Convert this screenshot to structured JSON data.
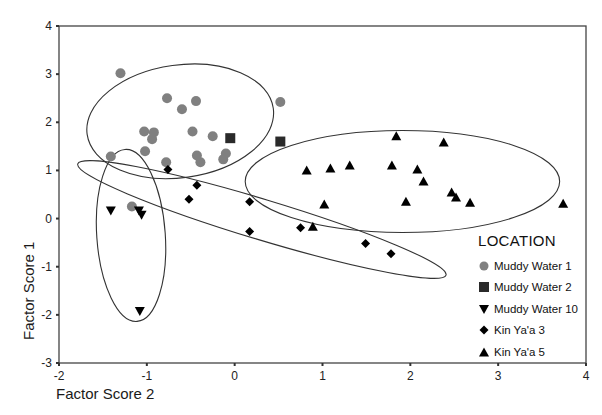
{
  "chart_data": {
    "type": "scatter",
    "title": "",
    "xlabel": "Factor Score 2",
    "ylabel": "Factor Score 1",
    "xlim": [
      -2,
      4
    ],
    "ylim": [
      -3,
      4
    ],
    "xticks": [
      "-2",
      "-1",
      "0",
      "1",
      "2",
      "3",
      "4"
    ],
    "yticks": [
      "4",
      "3",
      "2",
      "1",
      "0",
      "-1",
      "-2",
      "-3"
    ],
    "grid": false,
    "legend": {
      "title": "LOCATION",
      "position": "lower right (inside plot)"
    },
    "series": [
      {
        "name": "Muddy Water 1",
        "marker": "circle",
        "color": "#808080",
        "points": [
          [
            -1.3,
            3.02
          ],
          [
            -0.77,
            2.5
          ],
          [
            -0.44,
            2.44
          ],
          [
            -0.6,
            2.27
          ],
          [
            0.52,
            2.42
          ],
          [
            -1.03,
            1.81
          ],
          [
            -0.92,
            1.79
          ],
          [
            -0.94,
            1.65
          ],
          [
            -0.48,
            1.81
          ],
          [
            -0.25,
            1.71
          ],
          [
            -1.02,
            1.4
          ],
          [
            -1.41,
            1.29
          ],
          [
            -0.78,
            1.17
          ],
          [
            -0.43,
            1.31
          ],
          [
            -0.39,
            1.17
          ],
          [
            -0.1,
            1.35
          ],
          [
            -0.13,
            1.23
          ],
          [
            -1.17,
            0.25
          ]
        ]
      },
      {
        "name": "Muddy Water 2",
        "marker": "square",
        "color": "#2a2a2a",
        "points": [
          [
            -0.05,
            1.67
          ],
          [
            0.52,
            1.6
          ]
        ]
      },
      {
        "name": "Muddy Water 10",
        "marker": "triangle-down",
        "color": "#000000",
        "points": [
          [
            -1.41,
            0.17
          ],
          [
            -1.09,
            0.17
          ],
          [
            -1.06,
            0.08
          ],
          [
            -1.08,
            -1.92
          ]
        ]
      },
      {
        "name": "Kin Ya'a 3",
        "marker": "diamond",
        "color": "#000000",
        "points": [
          [
            -0.76,
            1.02
          ],
          [
            -0.43,
            0.69
          ],
          [
            -0.52,
            0.4
          ],
          [
            0.17,
            0.35
          ],
          [
            0.17,
            -0.27
          ],
          [
            0.75,
            -0.19
          ],
          [
            1.49,
            -0.52
          ],
          [
            1.78,
            -0.73
          ]
        ]
      },
      {
        "name": "Kin Ya'a 5",
        "marker": "triangle-up",
        "color": "#000000",
        "points": [
          [
            0.82,
            1.0
          ],
          [
            1.09,
            1.04
          ],
          [
            1.31,
            1.1
          ],
          [
            1.84,
            1.71
          ],
          [
            1.79,
            1.1
          ],
          [
            2.38,
            1.58
          ],
          [
            2.08,
            1.02
          ],
          [
            2.15,
            0.77
          ],
          [
            1.02,
            0.29
          ],
          [
            0.89,
            -0.17
          ],
          [
            1.95,
            0.35
          ],
          [
            2.47,
            0.54
          ],
          [
            2.52,
            0.44
          ],
          [
            2.68,
            0.33
          ],
          [
            3.74,
            0.31
          ]
        ]
      }
    ],
    "confidence_ellipses": [
      {
        "group": "Muddy Water 1",
        "cx": -0.62,
        "cy": 2.02,
        "rx_units": 1.07,
        "ry_units": 1.17,
        "rotation_deg": -8
      },
      {
        "group": "Muddy Water 10",
        "cx": -1.18,
        "cy": -0.35,
        "rx_units": 0.39,
        "ry_units": 1.79,
        "rotation_deg": -4
      },
      {
        "group": "Kin Ya'a 3",
        "cx": 0.31,
        "cy": -0.02,
        "rx_units": 2.19,
        "ry_units": 0.42,
        "rotation_deg": 16.8
      },
      {
        "group": "Kin Ya'a 5",
        "cx": 1.91,
        "cy": 0.77,
        "rx_units": 1.79,
        "ry_units": 1.06,
        "rotation_deg": 0
      }
    ]
  },
  "plot_box_px": {
    "left": 59,
    "top": 26,
    "right": 586,
    "bottom": 363
  }
}
